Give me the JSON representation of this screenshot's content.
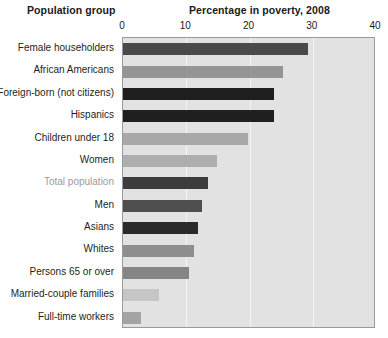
{
  "header": {
    "left_title": "Population group",
    "chart_title": "Percentage in poverty, 2008"
  },
  "chart_data": {
    "type": "bar",
    "orientation": "horizontal",
    "title": "Percentage in poverty, 2008",
    "xlabel": "",
    "ylabel": "Population group",
    "xlim": [
      0,
      40
    ],
    "ticks": [
      "0",
      "10",
      "20",
      "30",
      "40"
    ],
    "tick_values": [
      0,
      10,
      20,
      30,
      40
    ],
    "grid": true,
    "gridlines_at": [
      10,
      20,
      30
    ],
    "legend": "none",
    "plot_background": "#e2e2e2",
    "categories": [
      "Female householders",
      "African Americans",
      "Foreign-born (not citizens)",
      "Hispanics",
      "Children under 18",
      "Women",
      "Total population",
      "Men",
      "Asians",
      "Whites",
      "Persons 65 or over",
      "Married-couple families",
      "Full-time workers"
    ],
    "values": [
      29.3,
      25.3,
      23.9,
      23.9,
      19.8,
      14.9,
      13.4,
      12.5,
      11.8,
      11.2,
      10.4,
      5.7,
      2.8
    ],
    "bar_colors": [
      "#4a4a4a",
      "#959595",
      "#1f1f1f",
      "#1f1f1f",
      "#a8a8a8",
      "#aeaeae",
      "#3c3c3c",
      "#4f4f4f",
      "#2a2a2a",
      "#8e8e8e",
      "#858585",
      "#c6c6c6",
      "#a4a4a4"
    ],
    "highlighted_category": "Total population",
    "highlight_label_color": "#9b9b9b"
  }
}
